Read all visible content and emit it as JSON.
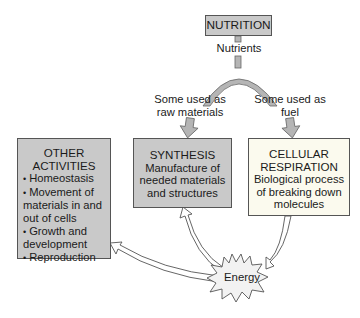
{
  "diagram": {
    "nutrition": {
      "label": "NUTRITION"
    },
    "nutrients_label": "Nutrients",
    "branch_left": {
      "line1": "Some used as",
      "line2": "raw materials"
    },
    "branch_right": {
      "line1": "Some used as",
      "line2": "fuel"
    },
    "synthesis": {
      "title": "SYNTHESIS",
      "lines": [
        "Manufacture of",
        "needed materials",
        "and structures"
      ]
    },
    "respiration": {
      "title1": "CELLULAR",
      "title2": "RESPIRATION",
      "lines": [
        "Biological process",
        "of breaking down",
        "molecules"
      ]
    },
    "other": {
      "title1": "OTHER",
      "title2": "ACTIVITIES",
      "items": [
        {
          "bullet": "•",
          "text": "Homeostasis"
        },
        {
          "bullet": "•",
          "text": "Movement of",
          "cont": [
            "materials in and",
            "out of cells"
          ]
        },
        {
          "bullet": "•",
          "text": "Growth and",
          "cont": [
            "development"
          ]
        },
        {
          "bullet": "•",
          "text": "Reproduction"
        }
      ]
    },
    "energy": {
      "label": "Energy"
    },
    "colors": {
      "box_gray": "#c9c9c9",
      "box_cream": "#fbfaee",
      "arc_gray": "#b5b5b5",
      "energy_fill": "#f2f2f2",
      "outline": "#555555"
    }
  }
}
